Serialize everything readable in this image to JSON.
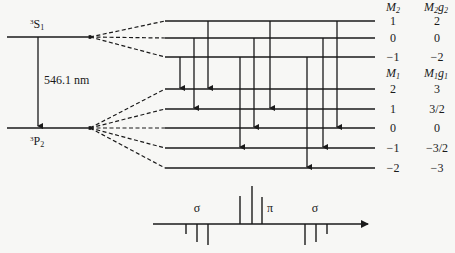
{
  "figure": {
    "upper_term": {
      "label": "S",
      "sup": "3",
      "sub": "1",
      "y": 37
    },
    "lower_term": {
      "label": "P",
      "sup": "3",
      "sub": "2",
      "y": 128
    },
    "wavelength_label": "546.1 nm",
    "colors": {
      "ink": "#1a1a1a",
      "background": "#f7f7f5"
    }
  },
  "upper_levels": {
    "header_m": {
      "base": "M",
      "sub": "2"
    },
    "header_mg": {
      "base": "M",
      "sub": "2",
      "tail": "g",
      "tailsub": "2"
    },
    "rows": [
      {
        "m": "1",
        "mg": "2",
        "y": 21
      },
      {
        "m": "0",
        "mg": "0",
        "y": 38
      },
      {
        "m": "−1",
        "mg": "−2",
        "y": 57
      }
    ]
  },
  "lower_levels": {
    "header_m": {
      "base": "M",
      "sub": "1"
    },
    "header_mg": {
      "base": "M",
      "sub": "1",
      "tail": "g",
      "tailsub": "1"
    },
    "rows": [
      {
        "m": "2",
        "mg": "3",
        "y": 89
      },
      {
        "m": "1",
        "mg": "3/2",
        "y": 109
      },
      {
        "m": "0",
        "mg": "0",
        "y": 128
      },
      {
        "m": "−1",
        "mg": "−3/2",
        "y": 148
      },
      {
        "m": "−2",
        "mg": "−3",
        "y": 168
      }
    ]
  },
  "transitions": [
    {
      "from": 2,
      "to": 0,
      "x": 180
    },
    {
      "from": 1,
      "to": 1,
      "x": 194
    },
    {
      "from": 0,
      "to": 0,
      "x": 208
    },
    {
      "from": 2,
      "to": 3,
      "x": 240
    },
    {
      "from": 1,
      "to": 2,
      "x": 254
    },
    {
      "from": 0,
      "to": 1,
      "x": 270
    },
    {
      "from": 2,
      "to": 4,
      "x": 307
    },
    {
      "from": 1,
      "to": 3,
      "x": 323
    },
    {
      "from": 0,
      "to": 2,
      "x": 337
    }
  ],
  "spectrum": {
    "axis_y": 224,
    "axis_x_start": 153,
    "axis_x_end": 368,
    "sigma_label": "σ",
    "pi_label": "π",
    "labels": [
      {
        "text": "σ",
        "x": 197,
        "y": 212
      },
      {
        "text": "π",
        "x": 270,
        "y": 212
      },
      {
        "text": "σ",
        "x": 315,
        "y": 212
      }
    ],
    "lines": [
      {
        "x": 186,
        "y1": 224,
        "y2": 234,
        "group": "sigma-left"
      },
      {
        "x": 197,
        "y1": 224,
        "y2": 242,
        "group": "sigma-left"
      },
      {
        "x": 208,
        "y1": 224,
        "y2": 245,
        "group": "sigma-left"
      },
      {
        "x": 240,
        "y1": 224,
        "y2": 196,
        "group": "pi"
      },
      {
        "x": 252,
        "y1": 224,
        "y2": 186,
        "group": "pi"
      },
      {
        "x": 262,
        "y1": 224,
        "y2": 197,
        "group": "pi"
      },
      {
        "x": 305,
        "y1": 224,
        "y2": 245,
        "group": "sigma-right"
      },
      {
        "x": 316,
        "y1": 224,
        "y2": 242,
        "group": "sigma-right"
      },
      {
        "x": 327,
        "y1": 224,
        "y2": 234,
        "group": "sigma-right"
      }
    ]
  }
}
